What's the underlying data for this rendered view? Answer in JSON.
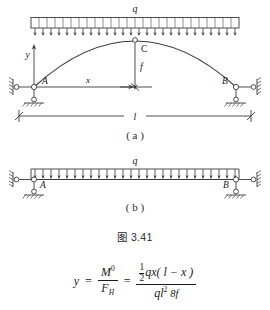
{
  "caption": "图 3.41",
  "figure_a": {
    "sublabel": "( a )",
    "load_label": "q",
    "axis_y_label": "y",
    "axis_x_label": "x",
    "support_left_label": "A",
    "support_right_label": "B",
    "crown_label": "C",
    "rise_label": "f",
    "span_label": "l",
    "load_arrow_count": 26,
    "description": "three-hinged parabolic arch under uniform distributed load"
  },
  "figure_b": {
    "sublabel": "( b )",
    "load_label": "q",
    "support_left_label": "A",
    "support_right_label": "B",
    "load_arrow_count": 26,
    "description": "equivalent simply supported beam under uniform distributed load"
  },
  "formula": {
    "lhs": "y",
    "equals": "=",
    "term1_num": "M",
    "term1_num_sup": "0",
    "term1_den": "F",
    "term1_den_sub": "H",
    "equals2": "=",
    "term2_num_frac_num": "1",
    "term2_num_frac_den": "2",
    "term2_num_rest": "qx( l − x )",
    "term2_den_main": "ql",
    "term2_den_sup": "2",
    "term2_den_sub": "8f"
  },
  "colors": {
    "ink": "#1a1a1a",
    "line": "#3a3a3a",
    "background": "#ffffff"
  }
}
